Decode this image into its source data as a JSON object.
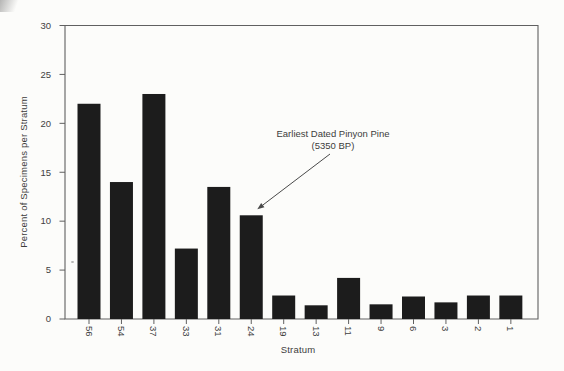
{
  "chart_data": {
    "type": "bar",
    "title": "",
    "xlabel": "Stratum",
    "ylabel": "Percent of Specimens per Stratum",
    "categories": [
      "56",
      "54",
      "37",
      "33",
      "31",
      "24",
      "19",
      "13",
      "11",
      "9",
      "6",
      "3",
      "2",
      "1"
    ],
    "values": [
      22.0,
      14.0,
      23.0,
      7.2,
      13.5,
      10.6,
      2.4,
      1.4,
      4.2,
      1.5,
      2.3,
      1.7,
      2.4,
      2.4
    ],
    "ylim": [
      0,
      30
    ],
    "yticks": [
      0,
      5,
      10,
      15,
      20,
      25,
      30
    ],
    "grid": false,
    "legend": "none",
    "bar_color": "#1c1c1c",
    "axis_color": "#606060",
    "text_color": "#3c3c3c",
    "annotation": {
      "text_line1": "Earliest Dated Pinyon Pine",
      "text_line2": "(5350 BP)",
      "target_category": "24"
    }
  }
}
